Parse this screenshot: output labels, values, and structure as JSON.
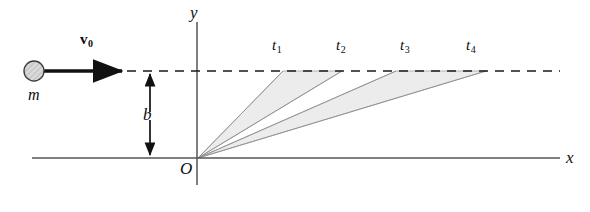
{
  "figure": {
    "background_color": "#ffffff",
    "width": 590,
    "height": 212
  },
  "axes": {
    "x_label": "x",
    "y_label": "y",
    "origin_label": "O",
    "axis_color": "#555555",
    "x_axis": {
      "x1": 32,
      "y1": 158,
      "x2": 560,
      "y2": 158
    },
    "y_axis": {
      "x1": 197,
      "y1": 22,
      "x2": 197,
      "y2": 185
    },
    "x_label_pos": {
      "x": 566,
      "y": 150
    },
    "y_label_pos": {
      "x": 190,
      "y": 4
    },
    "origin_label_pos": {
      "x": 180,
      "y": 160
    }
  },
  "particle": {
    "mass_label": "m",
    "mass_label_pos": {
      "x": 28,
      "y": 87
    },
    "circle": {
      "cx": 34,
      "cy": 71,
      "r": 10
    },
    "circle_fill": "#d9d9d9",
    "circle_stroke": "#3c3c3c",
    "velocity_label": "v",
    "velocity_subscript": "0",
    "velocity_label_pos": {
      "x": 80,
      "y": 33
    },
    "velocity_arrow": {
      "x1": 44,
      "y1": 71,
      "x2": 127,
      "y2": 71
    },
    "arrow_color": "#111111"
  },
  "impact_parameter": {
    "label": "b",
    "label_pos": {
      "x": 143,
      "y": 106
    },
    "arrow": {
      "x": 150,
      "y_top": 72,
      "y_bottom": 157
    },
    "color": "#111111"
  },
  "trajectory_line": {
    "description": "horizontal dashed path of the particle",
    "y": 71,
    "x_start": 127,
    "x_end": 560,
    "color": "#1a1a1a",
    "dash": "9 7"
  },
  "swept_rays": {
    "apex": {
      "x": 198,
      "y": 158
    },
    "ray_color": "#8e8e8e",
    "endpoints": [
      {
        "label": "t",
        "subscript": "1",
        "x": 283,
        "y": 71,
        "label_x": 272,
        "label_y": 38
      },
      {
        "label": "t",
        "subscript": "2",
        "x": 342,
        "y": 71,
        "label_x": 336,
        "label_y": 38
      },
      {
        "label": "t",
        "subscript": "3",
        "x": 396,
        "y": 71,
        "label_x": 400,
        "label_y": 38
      },
      {
        "label": "t",
        "subscript": "4",
        "x": 486,
        "y": 71,
        "label_x": 466,
        "label_y": 38
      }
    ]
  },
  "shaded_wedges": {
    "fill": "#ececec",
    "stroke": "#9a9a9a",
    "regions": [
      {
        "name": "wedge-t1-t2",
        "from_endpoint": 0,
        "to_endpoint": 1
      },
      {
        "name": "wedge-t3-t4",
        "from_endpoint": 2,
        "to_endpoint": 3
      }
    ]
  }
}
